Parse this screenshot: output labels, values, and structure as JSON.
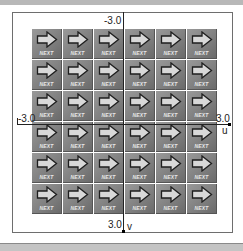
{
  "canvas": {
    "width": 243,
    "height": 250
  },
  "axes": {
    "u_min_label": "-3.0",
    "u_max_label": "3.0",
    "u_axis_name": "u",
    "v_min_label": "-3.0",
    "v_max_label": "3.0",
    "v_axis_name": "v"
  },
  "grid": {
    "rows": 6,
    "cols": 6,
    "tile_icon": "right-arrow-icon",
    "tile_label": "NEXT"
  },
  "colors": {
    "tile_bg": "#8a8a8a",
    "arrow_fill": "#d8d8d8",
    "frame": "#6e6e6e",
    "axis": "#222222"
  }
}
